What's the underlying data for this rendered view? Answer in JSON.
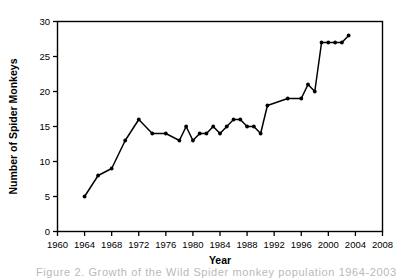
{
  "chart_data": {
    "type": "line",
    "title": "",
    "xlabel": "Year",
    "ylabel": "Number of Spider Monkeys",
    "xlim": [
      1960,
      2008
    ],
    "ylim": [
      0,
      30
    ],
    "xticks": [
      1960,
      1964,
      1968,
      1972,
      1976,
      1980,
      1984,
      1988,
      1992,
      1996,
      2000,
      2004,
      2008
    ],
    "yticks": [
      0,
      5,
      10,
      15,
      20,
      25,
      30
    ],
    "grid": false,
    "legend": false,
    "marker": "filled-circle",
    "line_color": "#000000",
    "x": [
      1964,
      1966,
      1968,
      1970,
      1972,
      1974,
      1976,
      1978,
      1979,
      1980,
      1981,
      1982,
      1983,
      1984,
      1985,
      1986,
      1987,
      1988,
      1989,
      1990,
      1991,
      1994,
      1996,
      1997,
      1998,
      1999,
      2000,
      2001,
      2002,
      2003
    ],
    "values": [
      5,
      8,
      9,
      13,
      16,
      14,
      14,
      13,
      15,
      13,
      14,
      14,
      15,
      14,
      15,
      16,
      16,
      15,
      15,
      14,
      18,
      19,
      19,
      21,
      20,
      27,
      27,
      27,
      27,
      28
    ]
  },
  "axis": {
    "ylabel": "Number of Spider Monkeys",
    "xlabel": "Year",
    "xticks": [
      "1960",
      "1964",
      "1968",
      "1972",
      "1976",
      "1980",
      "1984",
      "1988",
      "1992",
      "1996",
      "2000",
      "2004",
      "2008"
    ],
    "yticks": [
      "30",
      "25",
      "20",
      "15",
      "10",
      "5",
      "0"
    ]
  },
  "caption": {
    "text": "Figure 2. Growth of the Wild Spider monkey population 1964-2003"
  }
}
